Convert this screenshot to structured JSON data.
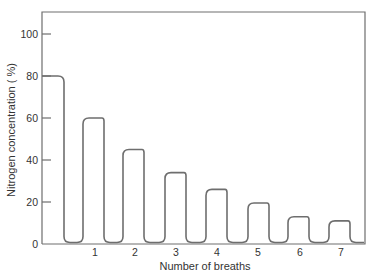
{
  "chart_data": {
    "type": "line",
    "title": "",
    "xlabel": "Number of breaths",
    "ylabel": "Nitrogen concentration ( %)",
    "ylim": [
      0,
      110
    ],
    "yticks": [
      0,
      20,
      40,
      60,
      80,
      100
    ],
    "ytick_labels": [
      "0",
      "20",
      "40",
      "60",
      "80",
      "100"
    ],
    "xticks": [
      1,
      2,
      3,
      4,
      5,
      6,
      7
    ],
    "xtick_labels": [
      "1",
      "2",
      "3",
      "4",
      "5",
      "6",
      "7"
    ],
    "grid": false,
    "legend": null,
    "series": [
      {
        "name": "Nitrogen concentration",
        "color": "#6e6e6e",
        "plateaus": [
          {
            "breath": 0,
            "value": 80
          },
          {
            "breath": 1,
            "value": 60
          },
          {
            "breath": 2,
            "value": 45
          },
          {
            "breath": 3,
            "value": 34
          },
          {
            "breath": 4,
            "value": 26
          },
          {
            "breath": 5,
            "value": 19.5
          },
          {
            "breath": 6,
            "value": 13
          },
          {
            "breath": 7,
            "value": 11
          }
        ]
      }
    ]
  }
}
